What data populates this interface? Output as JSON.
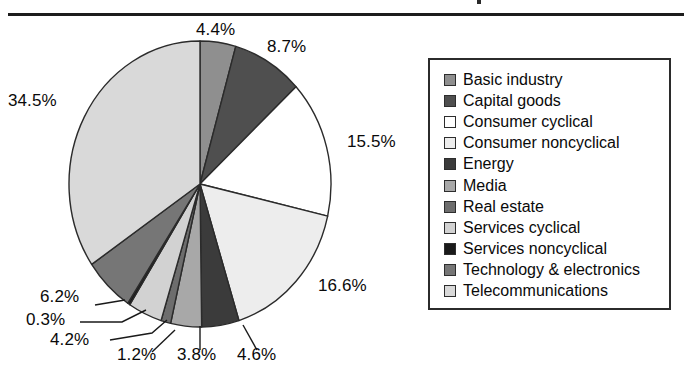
{
  "chart_data": {
    "type": "pie",
    "title": "",
    "xlabel": "",
    "ylabel": "",
    "legend_position": "right",
    "grid": false,
    "categories": [
      "Basic industry",
      "Capital goods",
      "Consumer cyclical",
      "Consumer noncyclical",
      "Energy",
      "Media",
      "Real estate",
      "Services cyclical",
      "Services noncyclical",
      "Technology & electronics",
      "Telecommunications"
    ],
    "values": [
      4.4,
      8.7,
      15.5,
      16.6,
      4.6,
      3.8,
      1.2,
      4.2,
      0.3,
      6.2,
      34.5
    ],
    "value_labels": [
      "4.4%",
      "8.7%",
      "15.5%",
      "16.6%",
      "4.6%",
      "3.8%",
      "1.2%",
      "4.2%",
      "0.3%",
      "6.2%",
      "34.5%"
    ],
    "slice_colors": [
      "#8f8f8f",
      "#4f4f4f",
      "#ffffff",
      "#ededed",
      "#3b3b3b",
      "#a8a8a8",
      "#6d6d6d",
      "#d2d2d2",
      "#1a1a1a",
      "#767676",
      "#d9d9d9"
    ],
    "start_angle_deg": 0,
    "direction": "clockwise",
    "units": "percent",
    "total": 100.0
  },
  "labels": {
    "basic_industry": "4.4%",
    "capital_goods": "8.7%",
    "consumer_cyclical": "15.5%",
    "consumer_noncyclical": "16.6%",
    "energy": "4.6%",
    "media": "3.8%",
    "real_estate": "1.2%",
    "services_cyclical": "4.2%",
    "services_noncyclical": "0.3%",
    "technology_electronics": "6.2%",
    "telecommunications": "34.5%"
  },
  "legend": {
    "items": [
      {
        "label": "Basic industry",
        "color": "#8f8f8f"
      },
      {
        "label": "Capital goods",
        "color": "#4f4f4f"
      },
      {
        "label": "Consumer cyclical",
        "color": "#ffffff"
      },
      {
        "label": "Consumer noncyclical",
        "color": "#ededed"
      },
      {
        "label": "Energy",
        "color": "#3b3b3b"
      },
      {
        "label": "Media",
        "color": "#a8a8a8"
      },
      {
        "label": "Real estate",
        "color": "#6d6d6d"
      },
      {
        "label": "Services cyclical",
        "color": "#d2d2d2"
      },
      {
        "label": "Services noncyclical",
        "color": "#1a1a1a"
      },
      {
        "label": "Technology & electronics",
        "color": "#767676"
      },
      {
        "label": "Telecommunications",
        "color": "#d9d9d9"
      }
    ]
  },
  "colors": {
    "rule": "#1c1c1c",
    "legend_border": "#2b2b2b",
    "slice_outline": "#2b2b2b",
    "text": "#0a0a0a",
    "background": "#ffffff"
  }
}
